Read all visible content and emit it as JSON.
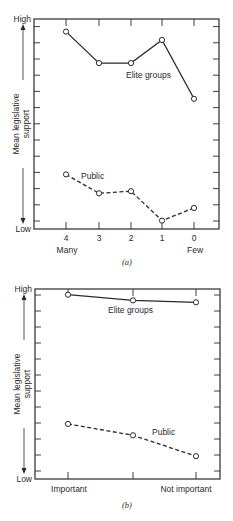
{
  "chart_data": [
    {
      "type": "line",
      "panel": "a",
      "caption": "(a)",
      "ylabel": "Mean legislative support",
      "ylabel_lines": [
        "Mean  legislative",
        "support"
      ],
      "y_high_label": "High",
      "y_low_label": "Low",
      "ylim": [
        0,
        1
      ],
      "y_ticks_count": 13,
      "grid": false,
      "categories": [
        "4",
        "3",
        "2",
        "1",
        "0"
      ],
      "x_end_labels": {
        "left": "Many",
        "right": "Few"
      },
      "series": [
        {
          "name": "Elite groups",
          "style": "solid",
          "values": [
            0.94,
            0.79,
            0.79,
            0.9,
            0.62
          ]
        },
        {
          "name": "Public",
          "style": "dashed",
          "values": [
            0.26,
            0.17,
            0.18,
            0.04,
            0.1
          ]
        }
      ]
    },
    {
      "type": "line",
      "panel": "b",
      "caption": "(b)",
      "ylabel": "Mean legislative support",
      "ylabel_lines": [
        "Mean  legislative",
        "support"
      ],
      "y_high_label": "High",
      "y_low_label": "Low",
      "ylim": [
        0,
        1
      ],
      "y_ticks_count": 12,
      "grid": false,
      "categories": [
        "Important",
        "",
        "Not  important"
      ],
      "series": [
        {
          "name": "Elite groups",
          "style": "solid",
          "values": [
            0.97,
            0.94,
            0.93
          ]
        },
        {
          "name": "Public",
          "style": "dashed",
          "values": [
            0.29,
            0.23,
            0.12
          ]
        }
      ]
    }
  ],
  "panels": {
    "a": {
      "caption": "(a)",
      "high": "High",
      "low": "Low",
      "ylabel1": "Mean  legislative",
      "ylabel2": "support",
      "xticks": [
        "4",
        "3",
        "2",
        "1",
        "0"
      ],
      "x_left": "Many",
      "x_right": "Few",
      "elite_label": "Elite  groups",
      "public_label": "Public"
    },
    "b": {
      "caption": "(b)",
      "high": "High",
      "low": "Low",
      "ylabel1": "Mean  legislative",
      "ylabel2": "support",
      "x_left": "Important",
      "x_right": "Not  important",
      "elite_label": "Elite  groups",
      "public_label": "Public"
    }
  },
  "colors": {
    "ink": "#2a2a2a",
    "background": "#ffffff"
  }
}
